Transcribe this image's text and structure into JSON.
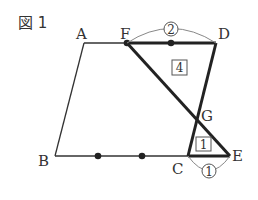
{
  "figure": {
    "title": "図 1",
    "points": {
      "A": {
        "label": "A",
        "x": 84,
        "y": 43
      },
      "F": {
        "label": "F",
        "x": 127,
        "y": 43
      },
      "D": {
        "label": "D",
        "x": 216,
        "y": 43
      },
      "B": {
        "label": "B",
        "x": 55,
        "y": 156
      },
      "C": {
        "label": "C",
        "x": 188,
        "y": 156
      },
      "E": {
        "label": "E",
        "x": 230,
        "y": 156
      },
      "G": {
        "label": "G",
        "x": 198,
        "y": 119
      }
    },
    "ratio_top": "2",
    "ratio_bottom": "1",
    "area_large": "4",
    "area_small": "1",
    "colors": {
      "line": "#333333",
      "thick": "#222222",
      "arc": "#888888"
    }
  }
}
